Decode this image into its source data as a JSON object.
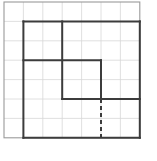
{
  "figure": {
    "title": "",
    "canvas": {
      "width": 157,
      "height": 161,
      "background": "#ffffff"
    },
    "grid": {
      "name": "square-lattice",
      "origin": {
        "x": 4,
        "y": 2
      },
      "cell_size": 19.4,
      "columns": 7,
      "rows": 7,
      "line_color": "#d8d8d8",
      "line_width": 0.8,
      "border_color": "#9a9a9a",
      "border_width": 1.1,
      "show_grid": true,
      "show_border": true
    },
    "style": {
      "stroke_color": "#3c3c3c",
      "stroke_width": 2.0,
      "dash_color": "#3c3c3c",
      "dash_width": 2.0,
      "dash_pattern": "4 3",
      "fill": "none",
      "line_join": "miter",
      "line_cap": "butt"
    },
    "shapes": [
      {
        "name": "stepped-polygon-outline",
        "type": "polyline",
        "dashed": false,
        "closed": true,
        "comment": "Vertices given in grid-cell units measured from the grid origin (col, row).",
        "points_grid": [
          [
            1,
            1
          ],
          [
            7,
            1
          ],
          [
            7,
            7
          ],
          [
            1,
            7
          ],
          [
            1,
            3
          ],
          [
            5,
            3
          ],
          [
            5,
            5
          ],
          [
            7,
            5
          ],
          [
            5,
            5
          ],
          [
            3,
            5
          ],
          [
            3,
            1
          ]
        ],
        "segments_grid": [
          {
            "name": "top-edge",
            "from": [
              1,
              1
            ],
            "to": [
              7,
              1
            ]
          },
          {
            "name": "right-edge",
            "from": [
              7,
              1
            ],
            "to": [
              7,
              7
            ]
          },
          {
            "name": "bottom-edge",
            "from": [
              7,
              7
            ],
            "to": [
              1,
              7
            ]
          },
          {
            "name": "left-edge",
            "from": [
              1,
              7
            ],
            "to": [
              1,
              1
            ]
          },
          {
            "name": "inner-upper-vertical",
            "from": [
              3,
              1
            ],
            "to": [
              3,
              5
            ]
          },
          {
            "name": "inner-middle-horizontal",
            "from": [
              1,
              3
            ],
            "to": [
              5,
              3
            ]
          },
          {
            "name": "inner-right-vertical",
            "from": [
              5,
              3
            ],
            "to": [
              5,
              5
            ]
          },
          {
            "name": "inner-lower-horizontal",
            "from": [
              3,
              5
            ],
            "to": [
              7,
              5
            ]
          }
        ]
      },
      {
        "name": "dashed-vertical-segment",
        "type": "line",
        "dashed": true,
        "from_grid": [
          5,
          5
        ],
        "to_grid": [
          5,
          7
        ]
      }
    ],
    "labels": []
  }
}
